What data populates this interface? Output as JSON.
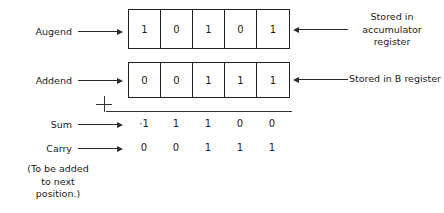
{
  "figure": {
    "type": "binary-addition-diagram",
    "rows": [
      {
        "label": "Augend",
        "kind": "register",
        "bits": [
          "1",
          "0",
          "1",
          "0",
          "1"
        ],
        "callout": "Stored in\naccumulator\nregister"
      },
      {
        "label": "Addend",
        "kind": "register",
        "bits": [
          "0",
          "0",
          "1",
          "1",
          "1"
        ],
        "callout": "Stored in B register"
      },
      {
        "label": "Sum",
        "kind": "digits",
        "bits": [
          "·1",
          "1",
          "1",
          "0",
          "0"
        ]
      },
      {
        "label": "Carry",
        "kind": "digits",
        "bits": [
          "0",
          "0",
          "1",
          "1",
          "1"
        ]
      }
    ],
    "operator": "+",
    "footnote": "(To be added\nto next\nposition.)"
  },
  "labels": {
    "augend": "Augend",
    "addend": "Addend",
    "sum": "Sum",
    "carry": "Carry"
  },
  "callouts": {
    "accumulator": "Stored in\naccumulator\nregister",
    "b_register": "Stored in B register"
  },
  "operator": {
    "plus": "+"
  },
  "footnote": {
    "text": "(To be added\nto next\nposition.)"
  },
  "bits": {
    "augend": [
      "1",
      "0",
      "1",
      "0",
      "1"
    ],
    "addend": [
      "0",
      "0",
      "1",
      "1",
      "1"
    ],
    "sum": [
      "·1",
      "1",
      "1",
      "0",
      "0"
    ],
    "carry": [
      "0",
      "0",
      "1",
      "1",
      "1"
    ]
  },
  "colors": {
    "ink": "#1b1b1b",
    "stroke": "#222222",
    "background": "#ffffff"
  }
}
